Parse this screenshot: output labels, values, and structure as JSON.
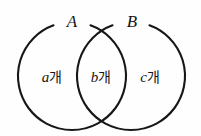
{
  "figure": {
    "kind": "venn-diagram-two-sets",
    "background_color": "#fefefe",
    "stroke_color": "#171717",
    "stroke_width": 2.1
  },
  "sets": {
    "left": {
      "label": "A",
      "label_x": 72,
      "label_y": 27,
      "center_x": 72,
      "center_y": 76,
      "radius": 54
    },
    "right": {
      "label": "B",
      "label_x": 132,
      "label_y": 27,
      "center_x": 131,
      "center_y": 76,
      "radius": 54
    }
  },
  "regions": [
    {
      "name": "left-only",
      "variable": "a",
      "unit": "개",
      "x": 52,
      "y": 82
    },
    {
      "name": "intersection",
      "variable": "b",
      "unit": "개",
      "x": 101,
      "y": 82
    },
    {
      "name": "right-only",
      "variable": "c",
      "unit": "개",
      "x": 150,
      "y": 82
    }
  ]
}
